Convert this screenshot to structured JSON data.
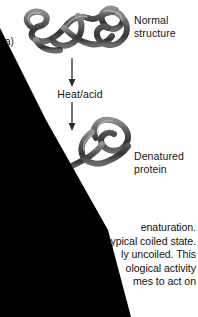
{
  "figure": {
    "panel_label": "a)",
    "diagram_type": "protein-denaturation",
    "steps": [
      {
        "name": "normal-protein",
        "label": "Normal\nstructure"
      },
      {
        "name": "treatment",
        "label": "Heat/acid"
      },
      {
        "name": "denatured-protein",
        "label": "Denatured\nprotein"
      }
    ],
    "labels": {
      "normal_structure_line1": "Normal",
      "normal_structure_line2": "structure",
      "heat_acid": "Heat/acid",
      "denatured_line1": "Denatured",
      "denatured_line2": "protein"
    }
  },
  "caption": {
    "lines": [
      "enaturation.",
      "ypical coiled state.",
      "ly uncoiled. This",
      "ological activity",
      "mes to act on"
    ]
  },
  "colors": {
    "background": "#ffffff",
    "text": "#111111",
    "occluder": "#000000",
    "coil_dark": "#3a3a3a",
    "coil_mid": "#6e6e6e",
    "coil_light": "#a8a8a8",
    "arrow": "#2b2b2b"
  }
}
